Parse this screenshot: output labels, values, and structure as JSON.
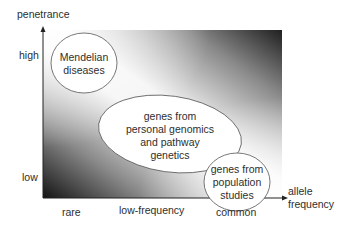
{
  "diagram": {
    "y_axis": {
      "title": "penetrance",
      "ticks": [
        "high",
        "low"
      ]
    },
    "x_axis": {
      "title_line1": "allele",
      "title_line2": "frequency",
      "ticks": [
        "rare",
        "low-frequency",
        "common"
      ]
    },
    "regions": [
      {
        "name": "mendelian",
        "line1": "Mendelian",
        "line2": "diseases"
      },
      {
        "name": "personal-genomics",
        "line1": "genes from",
        "line2": "personal genomics",
        "line3": "and pathway",
        "line4": "genetics"
      },
      {
        "name": "population",
        "line1": "genes from",
        "line2": "population",
        "line3": "studies"
      }
    ],
    "colors": {
      "dark": "#1a1a1a",
      "light": "#ffffff",
      "ink": "#333333"
    }
  }
}
